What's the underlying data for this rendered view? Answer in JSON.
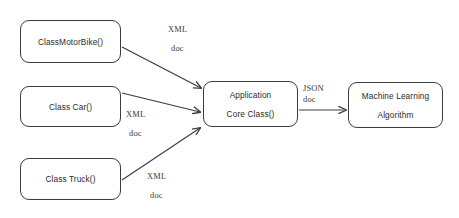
{
  "diagram": {
    "type": "flow-diagram",
    "background_color": "#ffffff",
    "stroke_color": "#3c3c3c",
    "text_color": "#2b2b2b",
    "nodes": [
      {
        "id": "motorbike",
        "label": "ClassMotorBike()",
        "line2": ""
      },
      {
        "id": "car",
        "label": "Class Car()",
        "line2": ""
      },
      {
        "id": "truck",
        "label": "Class Truck()",
        "line2": ""
      },
      {
        "id": "core",
        "label": "Application",
        "line2": "Core Class()"
      },
      {
        "id": "ml",
        "label": "Machine Learning",
        "line2": "Algorithm"
      }
    ],
    "edges": [
      {
        "id": "motorbike-to-core",
        "from": "motorbike",
        "to": "core",
        "label": "XML",
        "label2": "doc"
      },
      {
        "id": "car-to-core",
        "from": "car",
        "to": "core",
        "label": "XML",
        "label2": "doc"
      },
      {
        "id": "truck-to-core",
        "from": "truck",
        "to": "core",
        "label": "XML",
        "label2": "doc"
      },
      {
        "id": "core-to-ml",
        "from": "core",
        "to": "ml",
        "label": "JSON",
        "label2": "doc"
      }
    ]
  }
}
